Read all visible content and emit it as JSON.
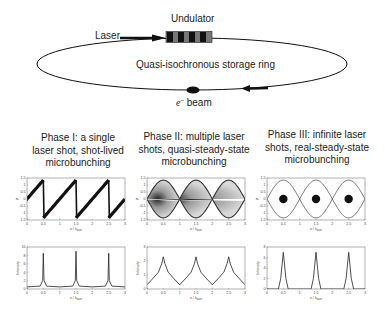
{
  "diagram": {
    "undulator_label": "Undulator",
    "laser_label": "Laser",
    "ring_label": "Quasi-isochronous storage ring",
    "beam_label_e": "e",
    "beam_label_sup": "−",
    "beam_label_rest": " beam"
  },
  "phases": [
    {
      "line1": "Phase I: a single",
      "line2": "laser shot, shot-lived",
      "line3": "microbunching"
    },
    {
      "line1": "Phase II: multiple laser",
      "line2": "shots, quasi-steady-state",
      "line3": "microbunching"
    },
    {
      "line1": "Phase III: infinite laser",
      "line2": "shots, real-steady-state",
      "line3": "microbunching"
    }
  ],
  "axes": {
    "x_label": "z / λ",
    "x_sub": "laser",
    "y_label_top": "P",
    "y_label_bottom": "Intensity"
  },
  "chart_data": [
    {
      "type": "scatter",
      "title": "Phase I phase space",
      "xlabel": "z / λ_laser",
      "ylabel": "P",
      "xlim": [
        0,
        3
      ],
      "ylim": [
        -1.5,
        1.5
      ],
      "xticks": [
        "0",
        "0.5",
        "1",
        "1.5",
        "2",
        "2.5",
        "3"
      ],
      "yticks": [
        "1.5",
        "1",
        "0.5",
        "0",
        "-0.5",
        "-1",
        "-1.5"
      ],
      "description": "sawtooth-shaped particle distribution, rising from -1.5 to 1.5 with sharp drops at z=0.5,1.5,2.5"
    },
    {
      "type": "scatter",
      "title": "Phase II phase space",
      "xlabel": "z / λ_laser",
      "ylabel": "P",
      "xlim": [
        0,
        3
      ],
      "ylim": [
        -1.5,
        1.5
      ],
      "xticks": [
        "0",
        "0.5",
        "1",
        "1.5",
        "2",
        "2.5",
        "3"
      ],
      "yticks": [
        "1.5",
        "1",
        "0.5",
        "0",
        "-0.5",
        "-1",
        "-1.5"
      ],
      "description": "filled separatrix buckets centered at z=0.5,1.5,2.5 with dense cores"
    },
    {
      "type": "scatter",
      "title": "Phase III phase space",
      "xlabel": "z / λ_laser",
      "ylabel": "P",
      "xlim": [
        0,
        3
      ],
      "ylim": [
        -1.5,
        1.5
      ],
      "xticks": [
        "0",
        "0.5",
        "1",
        "1.5",
        "2",
        "2.5",
        "3"
      ],
      "yticks": [
        "1.5",
        "1",
        "0.5",
        "0",
        "-0.5",
        "-1",
        "-1.5"
      ],
      "description": "empty separatrix buckets with compact round bunches at z=0.5,1.5,2.5"
    },
    {
      "type": "line",
      "title": "Phase I intensity",
      "xlabel": "z / λ_laser",
      "ylabel": "Intensity",
      "xlim": [
        0,
        3
      ],
      "ylim": [
        0,
        10
      ],
      "xticks": [
        "0",
        "0.5",
        "1",
        "1.5",
        "2",
        "2.5",
        "3"
      ],
      "yticks": [
        "0",
        "2",
        "4",
        "6",
        "8",
        "10"
      ],
      "x": [
        0,
        0.4,
        0.48,
        0.5,
        0.52,
        0.6,
        1,
        1.4,
        1.48,
        1.5,
        1.52,
        1.6,
        2,
        2.4,
        2.48,
        2.5,
        2.52,
        2.6,
        3
      ],
      "values": [
        0.5,
        0.7,
        2,
        8.5,
        2,
        0.7,
        0.5,
        0.7,
        2,
        9,
        2,
        0.7,
        0.5,
        0.7,
        2,
        8.5,
        2,
        0.7,
        0.5
      ]
    },
    {
      "type": "line",
      "title": "Phase II intensity",
      "xlabel": "z / λ_laser",
      "ylabel": "Intensity",
      "xlim": [
        0,
        3
      ],
      "ylim": [
        0,
        3
      ],
      "xticks": [
        "0",
        "0.5",
        "1",
        "1.5",
        "2",
        "2.5",
        "3"
      ],
      "yticks": [
        "0",
        "1",
        "2",
        "3"
      ],
      "x": [
        0,
        0.2,
        0.35,
        0.45,
        0.5,
        0.55,
        0.65,
        0.8,
        1,
        1.2,
        1.35,
        1.45,
        1.5,
        1.55,
        1.65,
        1.8,
        2,
        2.2,
        2.35,
        2.45,
        2.5,
        2.55,
        2.65,
        2.8,
        3
      ],
      "values": [
        0.3,
        0.8,
        1.2,
        1.8,
        2.3,
        1.8,
        1.2,
        0.8,
        0.3,
        0.8,
        1.2,
        1.8,
        2.3,
        1.8,
        1.2,
        0.8,
        0.3,
        0.8,
        1.2,
        1.8,
        2.3,
        1.8,
        1.2,
        0.8,
        0.3
      ]
    },
    {
      "type": "line",
      "title": "Phase III intensity",
      "xlabel": "z / λ_laser",
      "ylabel": "Intensity",
      "xlim": [
        0,
        3
      ],
      "ylim": [
        0,
        8
      ],
      "xticks": [
        "0",
        "0.5",
        "1",
        "1.5",
        "2",
        "2.5",
        "3"
      ],
      "yticks": [
        "0",
        "2",
        "4",
        "6",
        "8"
      ],
      "x": [
        0,
        0.35,
        0.42,
        0.5,
        0.58,
        0.65,
        1,
        1.35,
        1.42,
        1.5,
        1.58,
        1.65,
        2,
        2.35,
        2.42,
        2.5,
        2.58,
        2.65,
        3
      ],
      "values": [
        0,
        0,
        2,
        7,
        2,
        0,
        0,
        0,
        2,
        7,
        2,
        0,
        0,
        0,
        2,
        7,
        2,
        0,
        0
      ]
    }
  ]
}
